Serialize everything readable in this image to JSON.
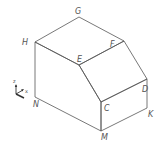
{
  "figure": {
    "type": "isometric-solid",
    "vertices": {
      "G": {
        "x": 79,
        "y": 17
      },
      "H": {
        "x": 35,
        "y": 42
      },
      "F": {
        "x": 124,
        "y": 41
      },
      "E": {
        "x": 79,
        "y": 65
      },
      "D": {
        "x": 147,
        "y": 79
      },
      "C": {
        "x": 101,
        "y": 102
      },
      "N": {
        "x": 35,
        "y": 97
      },
      "M": {
        "x": 101,
        "y": 131
      },
      "K": {
        "x": 147,
        "y": 108
      }
    },
    "labels": {
      "G": "G",
      "H": "H",
      "F": "F",
      "E": "E",
      "D": "D",
      "C": "C",
      "N": "N",
      "M": "M",
      "K": "K"
    },
    "axes": {
      "z": "z",
      "x": "x"
    },
    "colors": {
      "line": "#555555",
      "background": "#ffffff"
    }
  }
}
